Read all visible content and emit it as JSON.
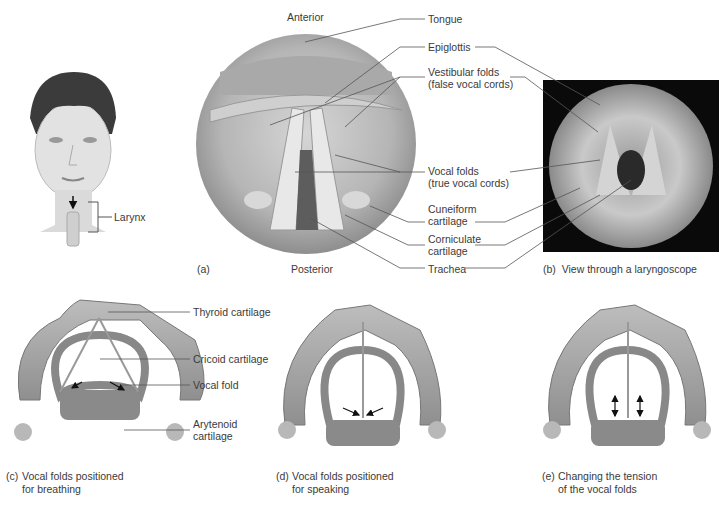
{
  "figure": {
    "head_panel": {
      "label": "Larynx"
    },
    "panel_a": {
      "tag": "(a)",
      "orientation_top": "Anterior",
      "orientation_bottom": "Posterior",
      "labels": {
        "tongue": "Tongue",
        "epiglottis": "Epiglottis",
        "vestibular_1": "Vestibular folds",
        "vestibular_2": "(false vocal cords)",
        "vocal_1": "Vocal folds",
        "vocal_2": "(true vocal cords)",
        "cuneiform_1": "Cuneiform",
        "cuneiform_2": "cartilage",
        "corniculate_1": "Corniculate",
        "corniculate_2": "cartilage",
        "trachea": "Trachea"
      }
    },
    "panel_b": {
      "tag": "(b)",
      "caption": "View through a laryngoscope"
    },
    "panel_c": {
      "tag": "(c)",
      "caption_1": "Vocal folds positioned",
      "caption_2": "for breathing",
      "labels": {
        "thyroid": "Thyroid cartilage",
        "cricoid": "Cricoid cartilage",
        "vocal_fold": "Vocal fold",
        "arytenoid_1": "Arytenoid",
        "arytenoid_2": "cartilage"
      }
    },
    "panel_d": {
      "tag": "(d)",
      "caption_1": "Vocal folds positioned",
      "caption_2": "for speaking"
    },
    "panel_e": {
      "tag": "(e)",
      "caption_1": "Changing the tension",
      "caption_2": "of the vocal folds"
    }
  }
}
